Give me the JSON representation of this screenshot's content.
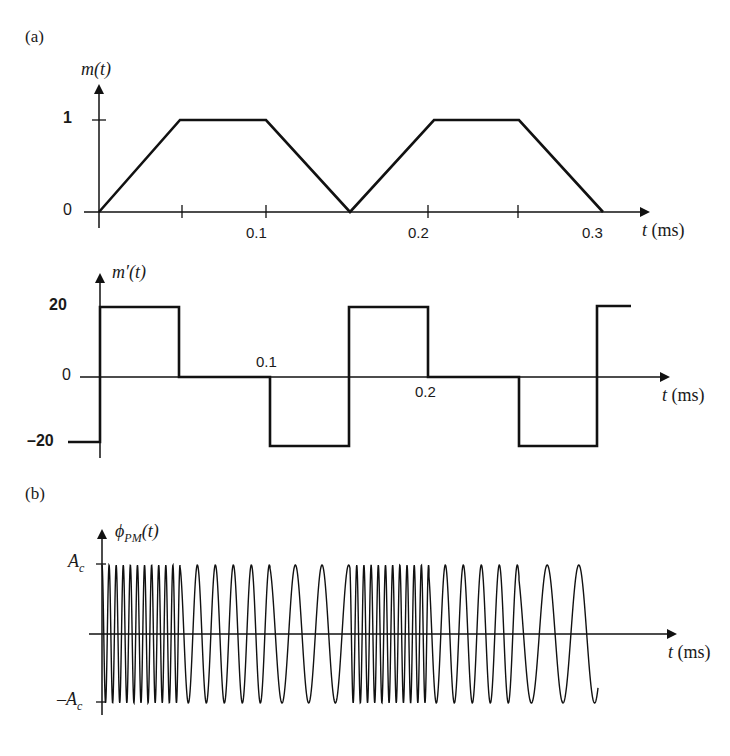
{
  "chart_data": [
    {
      "panel": "(a) top",
      "type": "line",
      "title": "",
      "ylabel": "m(t)",
      "xlabel": "t (ms)",
      "x": [
        0,
        0.05,
        0.1,
        0.15,
        0.2,
        0.25,
        0.3
      ],
      "values": [
        0,
        1,
        1,
        0,
        1,
        1,
        0
      ],
      "xticks": [
        "0.1",
        "0.2",
        "0.3"
      ],
      "yticks": [
        "0",
        "1"
      ],
      "ylim": [
        0,
        1
      ],
      "xlim": [
        0,
        0.3
      ]
    },
    {
      "panel": "(a) bottom",
      "type": "line",
      "step": true,
      "ylabel": "m'(t)",
      "xlabel": "t (ms)",
      "x": [
        0,
        0.05,
        0.1,
        0.15,
        0.2,
        0.25,
        0.3
      ],
      "values": [
        20,
        0,
        -20,
        20,
        0,
        -20,
        20
      ],
      "xticks": [
        "0.1",
        "0.2"
      ],
      "yticks": [
        "-20",
        "0",
        "20"
      ],
      "ylim": [
        -20,
        20
      ]
    },
    {
      "panel": "(b)",
      "type": "line",
      "ylabel": "φPM(t)",
      "xlabel": "t (ms)",
      "yticks": [
        "-Ac",
        "Ac"
      ],
      "description": "PM wave: high-frequency bursts where m'(t)=20, carrier frequency where m'(t)=0, lower frequency where m'(t)=-20; amplitude Ac constant"
    }
  ],
  "labels": {
    "panel_a": "(a)",
    "panel_b": "(b)",
    "m_axis": "m(t)",
    "m_prime_axis": "m′(t)",
    "phi_axis_main": "ϕ",
    "phi_axis_sub": "PM",
    "phi_axis_tail": "(t)",
    "t_axis": "t",
    "t_unit": "(ms)",
    "tick_0": "0",
    "tick_1": "1",
    "tick_20": "20",
    "tick_m20": "–20",
    "tick_01": "0.1",
    "tick_02": "0.2",
    "tick_03": "0.3",
    "ac": "A",
    "ac_sub": "c",
    "mac": "–A"
  }
}
